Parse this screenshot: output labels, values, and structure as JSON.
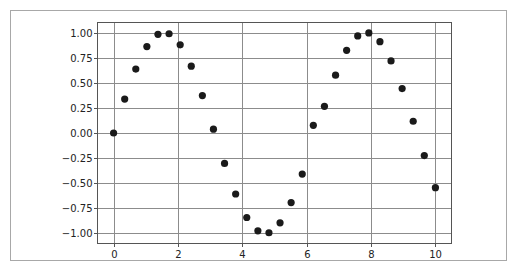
{
  "chart_data": {
    "type": "scatter",
    "title": "",
    "xlabel": "",
    "ylabel": "",
    "xlim": [
      -0.5,
      10.5
    ],
    "ylim": [
      -1.1,
      1.1
    ],
    "grid": true,
    "legend": null,
    "marker_color": "#1a1a1a",
    "grid_color": "#8c8c8c",
    "x_ticks": [
      0,
      2,
      4,
      6,
      8,
      10
    ],
    "x_tick_labels": [
      "0",
      "2",
      "4",
      "6",
      "8",
      "10"
    ],
    "y_ticks": [
      1.0,
      0.75,
      0.5,
      0.25,
      0.0,
      -0.25,
      -0.5,
      -0.75,
      -1.0
    ],
    "y_tick_labels": [
      "1.00",
      "0.75",
      "0.50",
      "0.25",
      "0.00",
      "−0.25",
      "−0.50",
      "−0.75",
      "−1.00"
    ],
    "x": [
      0.0,
      0.345,
      0.69,
      1.034,
      1.379,
      1.724,
      2.069,
      2.414,
      2.759,
      3.103,
      3.448,
      3.793,
      4.138,
      4.483,
      4.828,
      5.172,
      5.517,
      5.862,
      6.207,
      6.552,
      6.897,
      7.241,
      7.586,
      7.931,
      8.276,
      8.621,
      8.966,
      9.31,
      9.655,
      10.0
    ],
    "y": [
      0.0,
      0.338,
      0.636,
      0.86,
      0.982,
      0.988,
      0.878,
      0.665,
      0.373,
      0.038,
      -0.303,
      -0.607,
      -0.841,
      -0.974,
      -0.993,
      -0.894,
      -0.693,
      -0.409,
      0.076,
      0.266,
      0.576,
      0.823,
      0.966,
      0.996,
      0.909,
      0.717,
      0.442,
      0.117,
      -0.225,
      -0.544
    ]
  }
}
